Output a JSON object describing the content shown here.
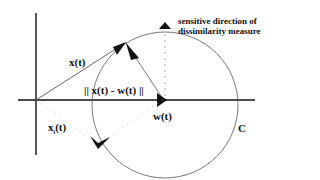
{
  "diagram": {
    "type": "vector-geometry",
    "labels": {
      "x_vector": "x(t)",
      "norm": "|| x(t) - w(t) ||",
      "w_vector": "w(t)",
      "xi_base": "x",
      "xi_sub": "i",
      "xi_arg": "(t)",
      "circle": "C",
      "note_line1": "sensitive direction of",
      "note_line2": "dissimilarity measure"
    },
    "colors": {
      "ink": "#111111",
      "circle": "#555555",
      "dotted": "#aaaaaa",
      "background": "#ffffff"
    },
    "geometry": {
      "origin": [
        36,
        100
      ],
      "circle_center": [
        165,
        105
      ],
      "circle_radius": 73,
      "x_tip": [
        125,
        43
      ],
      "w_tip": [
        165,
        100
      ],
      "xi_tip": [
        97,
        145
      ],
      "sensitive_arrow_tip": [
        165,
        25
      ]
    }
  }
}
